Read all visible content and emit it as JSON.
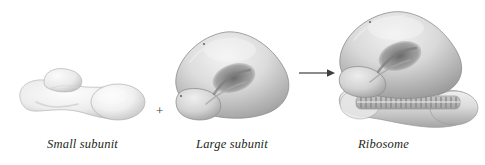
{
  "figure": {
    "type": "biology-diagram",
    "background_color": "#ffffff",
    "ink_color": "#231f20"
  },
  "labels": {
    "small_subunit": "Small subunit",
    "large_subunit": "Large subunit",
    "ribosome": "Ribosome"
  },
  "operators": {
    "plus": "+",
    "arrow": "arrow-right"
  },
  "structures": [
    {
      "id": "small-subunit",
      "name": "Small subunit",
      "description": "elongated pale grey lobed mass with small finger-like upper lobe",
      "fill": "#e9e9e9",
      "shade": "#bdbdbd"
    },
    {
      "id": "large-subunit",
      "name": "Large subunit",
      "description": "rounded triangular grey mass with dark interior groove and lower-left protruding lobe",
      "fill": "#d8d8d8",
      "shade": "#8f8f8f",
      "groove": "#6e6e6e"
    },
    {
      "id": "ribosome",
      "name": "Ribosome",
      "description": "large subunit seated on small subunit with ridged interface band",
      "fill": "#d6d6d6",
      "shade": "#8a8a8a",
      "ridge_count": 20,
      "ridge_color": "#9a9a9a"
    }
  ]
}
